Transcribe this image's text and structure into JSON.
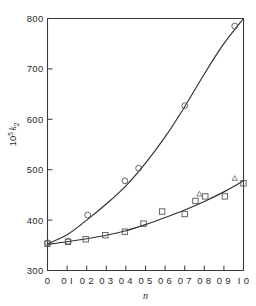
{
  "figure": {
    "background_color": "#ffffff",
    "axis_color": "#3a3a3a",
    "curve_color": "#2f2f2f",
    "marker_color": "#555555"
  },
  "chart_data": {
    "type": "scatter",
    "title": "",
    "xlabel": "n",
    "ylabel": "10⁵ k₂",
    "ylabel_parts": {
      "base": "10",
      "exponent": "5",
      "symbol": "k",
      "subscript": "2"
    },
    "xlim": [
      0,
      1.0
    ],
    "ylim": [
      300,
      800
    ],
    "grid": false,
    "legend": "none",
    "x_ticks": [
      0,
      0.1,
      0.2,
      0.3,
      0.4,
      0.5,
      0.6,
      0.7,
      0.8,
      0.9,
      1.0
    ],
    "x_ticklabels": [
      "0",
      "0 I",
      "0 2",
      "0 3",
      "0 4",
      "0 5",
      "0 6",
      "0 7",
      "0 8",
      "0 9",
      "I 0"
    ],
    "y_ticks": [
      300,
      400,
      500,
      600,
      700,
      800
    ],
    "y_ticklabels": [
      "300",
      "400",
      "500",
      "600",
      "700",
      "800"
    ],
    "series": [
      {
        "name": "upper-curve",
        "marker": "circle",
        "points": [
          {
            "x": 0.0,
            "y": 355
          },
          {
            "x": 0.105,
            "y": 358
          },
          {
            "x": 0.205,
            "y": 410
          },
          {
            "x": 0.395,
            "y": 478
          },
          {
            "x": 0.465,
            "y": 503
          },
          {
            "x": 0.7,
            "y": 627
          },
          {
            "x": 0.955,
            "y": 785
          }
        ],
        "fit_curve": [
          {
            "x": 0.0,
            "y": 353
          },
          {
            "x": 0.1,
            "y": 371
          },
          {
            "x": 0.2,
            "y": 400
          },
          {
            "x": 0.3,
            "y": 432
          },
          {
            "x": 0.4,
            "y": 468
          },
          {
            "x": 0.5,
            "y": 513
          },
          {
            "x": 0.6,
            "y": 565
          },
          {
            "x": 0.7,
            "y": 625
          },
          {
            "x": 0.8,
            "y": 690
          },
          {
            "x": 0.9,
            "y": 750
          },
          {
            "x": 1.0,
            "y": 800
          }
        ]
      },
      {
        "name": "lower-curve",
        "marker": "square",
        "points": [
          {
            "x": 0.0,
            "y": 353
          },
          {
            "x": 0.105,
            "y": 357
          },
          {
            "x": 0.195,
            "y": 362
          },
          {
            "x": 0.295,
            "y": 370
          },
          {
            "x": 0.395,
            "y": 377
          },
          {
            "x": 0.49,
            "y": 393
          },
          {
            "x": 0.585,
            "y": 417
          },
          {
            "x": 0.7,
            "y": 412
          },
          {
            "x": 0.755,
            "y": 438
          },
          {
            "x": 0.805,
            "y": 447
          },
          {
            "x": 0.905,
            "y": 447
          },
          {
            "x": 1.0,
            "y": 473
          }
        ],
        "fit_curve": [
          {
            "x": 0.0,
            "y": 352
          },
          {
            "x": 0.1,
            "y": 357
          },
          {
            "x": 0.2,
            "y": 363
          },
          {
            "x": 0.3,
            "y": 370
          },
          {
            "x": 0.4,
            "y": 379
          },
          {
            "x": 0.5,
            "y": 391
          },
          {
            "x": 0.6,
            "y": 405
          },
          {
            "x": 0.7,
            "y": 420
          },
          {
            "x": 0.8,
            "y": 437
          },
          {
            "x": 0.9,
            "y": 456
          },
          {
            "x": 1.0,
            "y": 478
          }
        ]
      },
      {
        "name": "triangle-points",
        "marker": "triangle",
        "points": [
          {
            "x": 0.775,
            "y": 452
          },
          {
            "x": 0.955,
            "y": 483
          }
        ]
      }
    ]
  }
}
